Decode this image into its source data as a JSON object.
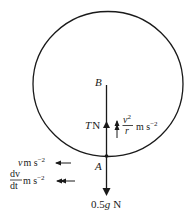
{
  "diagram": {
    "type": "free-body diagram, vertical circle",
    "colors": {
      "line": "#1a1a1a",
      "background": "#ffffff"
    },
    "points": {
      "top": {
        "label": "B"
      },
      "bottom": {
        "label": "A"
      }
    },
    "forces": {
      "tension": {
        "symbol": "T",
        "unit": "N"
      },
      "weight": {
        "value": "0.5",
        "symbol": "g",
        "unit": "N"
      }
    },
    "accelerations": {
      "centripetal": {
        "numerator": "v",
        "numerator_sup": "2",
        "denominator": "r",
        "unit": "m s",
        "unit_sup": "−2"
      },
      "velocity": {
        "symbol": "v",
        "unit": "m s",
        "unit_sup": "−2"
      },
      "tangential": {
        "numerator": "dv",
        "denominator": "dt",
        "unit": "m s",
        "unit_sup": "−2"
      }
    }
  }
}
